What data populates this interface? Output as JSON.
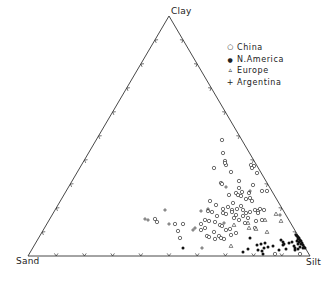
{
  "chart_data": {
    "type": "ternary-scatter",
    "title": "",
    "vertices": {
      "top": "Clay",
      "left": "Sand",
      "right": "Silt"
    },
    "vertex_px": {
      "top": [
        169,
        16
      ],
      "left": [
        28,
        256
      ],
      "right": [
        310,
        256
      ]
    },
    "ticks_per_side": 9,
    "legend": [
      {
        "name": "China",
        "marker": "open-circle"
      },
      {
        "name": "N.America",
        "marker": "filled-circle"
      },
      {
        "name": "Europe",
        "marker": "open-triangle"
      },
      {
        "name": "Argentina",
        "marker": "plus"
      }
    ],
    "series": [
      {
        "name": "China",
        "marker": "open-circle",
        "points_px": [
          [
            222,
            140
          ],
          [
            223,
            153
          ],
          [
            225,
            161
          ],
          [
            214,
            168
          ],
          [
            226,
            165
          ],
          [
            225,
            163
          ],
          [
            231,
            172
          ],
          [
            251,
            165
          ],
          [
            254,
            166
          ],
          [
            257,
            173
          ],
          [
            252,
            168
          ],
          [
            221,
            183
          ],
          [
            222,
            184
          ],
          [
            239,
            181
          ],
          [
            229,
            195
          ],
          [
            239,
            188
          ],
          [
            236,
            193
          ],
          [
            238,
            195
          ],
          [
            241,
            196
          ],
          [
            242,
            192
          ],
          [
            246,
            199
          ],
          [
            249,
            193
          ],
          [
            253,
            185
          ],
          [
            250,
            198
          ],
          [
            252,
            201
          ],
          [
            262,
            191
          ],
          [
            267,
            191
          ],
          [
            210,
            201
          ],
          [
            216,
            205
          ],
          [
            223,
            209
          ],
          [
            228,
            207
          ],
          [
            232,
            210
          ],
          [
            233,
            203
          ],
          [
            237,
            209
          ],
          [
            241,
            206
          ],
          [
            243,
            210
          ],
          [
            246,
            213
          ],
          [
            250,
            212
          ],
          [
            255,
            210
          ],
          [
            258,
            211
          ],
          [
            260,
            209
          ],
          [
            208,
            211
          ],
          [
            212,
            212
          ],
          [
            217,
            216
          ],
          [
            223,
            213
          ],
          [
            226,
            214
          ],
          [
            232,
            212
          ],
          [
            236,
            215
          ],
          [
            239,
            220
          ],
          [
            243,
            216
          ],
          [
            248,
            218
          ],
          [
            256,
            221
          ],
          [
            234,
            218
          ],
          [
            245,
            223
          ],
          [
            205,
            220
          ],
          [
            209,
            221
          ],
          [
            215,
            222
          ],
          [
            220,
            225
          ],
          [
            222,
            226
          ],
          [
            226,
            230
          ],
          [
            230,
            229
          ],
          [
            236,
            233
          ],
          [
            255,
            228
          ],
          [
            201,
            224
          ],
          [
            205,
            228
          ],
          [
            214,
            232
          ],
          [
            219,
            236
          ],
          [
            224,
            239
          ],
          [
            231,
            235
          ],
          [
            155,
            219
          ],
          [
            157,
            222
          ],
          [
            175,
            224
          ],
          [
            183,
            224
          ],
          [
            178,
            231
          ],
          [
            180,
            238
          ],
          [
            201,
            230
          ],
          [
            207,
            236
          ],
          [
            209,
            237
          ],
          [
            215,
            239
          ],
          [
            221,
            238
          ],
          [
            262,
            220
          ],
          [
            258,
            213
          ],
          [
            264,
            210
          ],
          [
            275,
            254
          ],
          [
            300,
            254
          ]
        ]
      },
      {
        "name": "N.America",
        "marker": "filled-circle",
        "points_px": [
          [
            250,
            238
          ],
          [
            257,
            245
          ],
          [
            261,
            244
          ],
          [
            243,
            252
          ],
          [
            248,
            249
          ],
          [
            265,
            243
          ],
          [
            264,
            248
          ],
          [
            258,
            250
          ],
          [
            262,
            251
          ],
          [
            268,
            247
          ],
          [
            273,
            246
          ],
          [
            281,
            240
          ],
          [
            283,
            245
          ],
          [
            284,
            244
          ],
          [
            279,
            250
          ],
          [
            286,
            249
          ],
          [
            283,
            242
          ],
          [
            289,
            243
          ],
          [
            292,
            242
          ],
          [
            294,
            246
          ],
          [
            295,
            250
          ],
          [
            296,
            235
          ],
          [
            297,
            236
          ],
          [
            298,
            237
          ],
          [
            299,
            238
          ],
          [
            298,
            239
          ],
          [
            300,
            240
          ],
          [
            301,
            241
          ],
          [
            299,
            242
          ],
          [
            302,
            243
          ],
          [
            301,
            244
          ],
          [
            303,
            245
          ],
          [
            300,
            247
          ],
          [
            304,
            247
          ],
          [
            303,
            248
          ],
          [
            305,
            248
          ],
          [
            298,
            249
          ],
          [
            295,
            248
          ],
          [
            298,
            244
          ],
          [
            297,
            241
          ],
          [
            263,
            254
          ],
          [
            183,
            248
          ]
        ]
      },
      {
        "name": "Europe",
        "marker": "open-triangle",
        "points_px": [
          [
            234,
            225
          ],
          [
            248,
            223
          ],
          [
            249,
            228
          ],
          [
            265,
            220
          ],
          [
            267,
            232
          ],
          [
            281,
            221
          ],
          [
            231,
            246
          ],
          [
            256,
            229
          ],
          [
            276,
            214
          ]
        ]
      },
      {
        "name": "Argentina",
        "marker": "plus",
        "points_px": [
          [
            165,
            210
          ],
          [
            145,
            219
          ],
          [
            148,
            220
          ],
          [
            169,
            224
          ],
          [
            193,
            230
          ],
          [
            195,
            228
          ],
          [
            202,
            248
          ],
          [
            201,
            211
          ],
          [
            208,
            209
          ],
          [
            224,
            223
          ],
          [
            250,
            191
          ],
          [
            280,
            215
          ],
          [
            226,
            187
          ]
        ]
      }
    ]
  },
  "labels": {
    "clay": "Clay",
    "sand": "Sand",
    "silt": "Silt"
  },
  "legend": {
    "items": [
      {
        "symbol": "○",
        "label": "China"
      },
      {
        "symbol": "●",
        "label": "N.America"
      },
      {
        "symbol": "▵",
        "label": "Europe"
      },
      {
        "symbol": "+",
        "label": "Argentina"
      }
    ]
  }
}
